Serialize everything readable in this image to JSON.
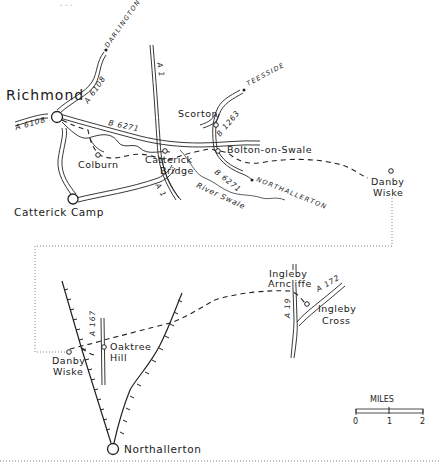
{
  "header": {
    "cut_off_title_fragment": "..."
  },
  "towns": {
    "richmond": "Richmond",
    "catterick_camp": "Catterick Camp",
    "northallerton": "Northallerton"
  },
  "villages": {
    "colburn": "Colburn",
    "catterick_bridge_1": "Catterick",
    "catterick_bridge_2": "Bridge",
    "scorton": "Scorton",
    "bolton_on_swale": "Bolton-on-Swale",
    "danby_wiske_top_1": "Danby",
    "danby_wiske_top_2": "Wiske",
    "danby_wiske_bottom_1": "Danby",
    "danby_wiske_bottom_2": "Wiske",
    "oaktree_hill_1": "Oaktree",
    "oaktree_hill_2": "Hill",
    "ingleby_arncliffe_1": "Ingleby",
    "ingleby_arncliffe_2": "Arncliffe",
    "ingleby_cross_1": "Ingleby",
    "ingleby_cross_2": "Cross"
  },
  "roads": {
    "a6108_north": "A 6108",
    "a6108_west": "A 6108",
    "b6271_west": "B 6271",
    "b6271_east": "B 6271",
    "b1263": "B 1263",
    "a1_north": "A 1",
    "a1_south": "A 1",
    "a167": "A 167",
    "a19": "A 19",
    "a172": "A 172"
  },
  "destinations": {
    "darlington": "DARLINGTON",
    "teesside": "TEESSIDE",
    "northallerton": "NORTHALLERTON"
  },
  "features": {
    "river_swale": "River Swale"
  },
  "scale": {
    "unit": "MILES",
    "ticks": [
      "0",
      "1",
      "2"
    ]
  }
}
